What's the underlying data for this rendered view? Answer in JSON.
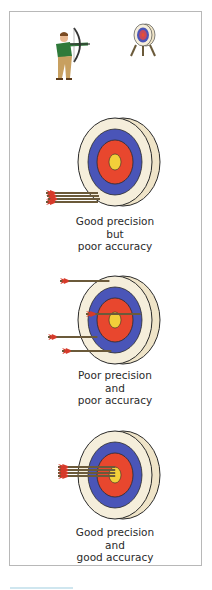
{
  "scenes": {
    "header": {
      "archer": "archer-illustration",
      "target": "target-on-stand"
    },
    "panels": [
      {
        "caption": [
          "Good precision",
          "but",
          "poor accuracy"
        ],
        "arrows": "clustered-off-center"
      },
      {
        "caption": [
          "Poor precision",
          "and",
          "poor accuracy"
        ],
        "arrows": "scattered"
      },
      {
        "caption": [
          "Good precision",
          "and",
          "good accuracy"
        ],
        "arrows": "clustered-bullseye"
      }
    ]
  },
  "colors": {
    "outer_ring": "#f3ead2",
    "blue_ring": "#4a55b8",
    "red_ring": "#e8472e",
    "bullseye": "#f2cf3a",
    "arrow_shaft": "#6b5a3a",
    "fletching": "#d63a2a",
    "frame": "#b8b8b8"
  }
}
